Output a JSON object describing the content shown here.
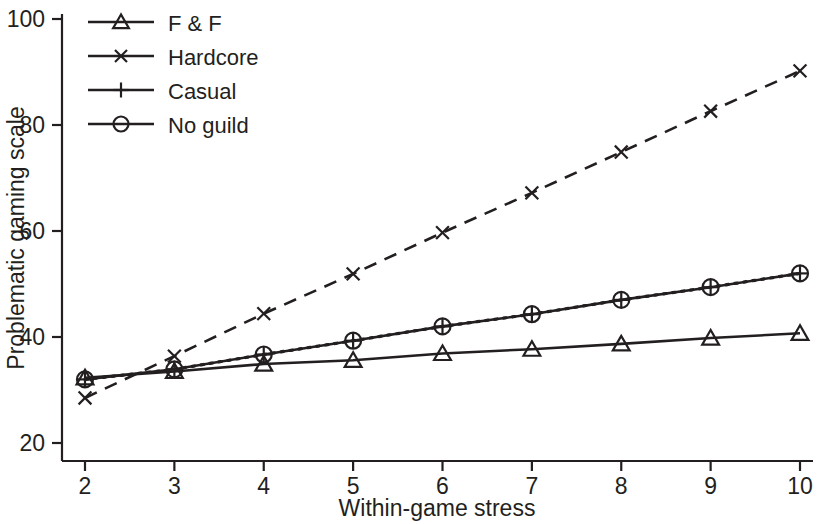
{
  "chart_data": {
    "type": "line",
    "title": "",
    "xlabel": "Within-game stress",
    "ylabel": "Problematic gaming scale",
    "x": [
      2,
      3,
      4,
      5,
      6,
      7,
      8,
      9,
      10
    ],
    "xlim": [
      2,
      10
    ],
    "ylim": [
      20,
      100
    ],
    "xticks": [
      "2",
      "3",
      "4",
      "5",
      "6",
      "7",
      "8",
      "9",
      "10"
    ],
    "yticks": [
      "20",
      "40",
      "60",
      "80",
      "100"
    ],
    "grid": false,
    "legend_position": "top-left",
    "series": [
      {
        "name": "F & F",
        "marker": "triangle",
        "linestyle": "solid",
        "color": "#231f20",
        "values": [
          32.3,
          33.5,
          34.9,
          35.6,
          36.9,
          37.7,
          38.7,
          39.8,
          40.7
        ]
      },
      {
        "name": "Hardcore",
        "marker": "cross",
        "linestyle": "dashed",
        "color": "#231f20",
        "values": [
          28.5,
          36.4,
          44.4,
          51.9,
          59.7,
          67.2,
          74.9,
          82.6,
          90.2
        ]
      },
      {
        "name": "Casual",
        "marker": "plus",
        "linestyle": "solid",
        "color": "#231f20",
        "values": [
          32.0,
          33.9,
          36.7,
          39.3,
          42.0,
          44.3,
          47.0,
          49.4,
          52.0
        ]
      },
      {
        "name": "No guild",
        "marker": "circle",
        "linestyle": "dotted",
        "color": "#231f20",
        "values": [
          32.0,
          33.9,
          36.7,
          39.3,
          42.0,
          44.3,
          47.0,
          49.4,
          52.0
        ]
      }
    ]
  },
  "legend": {
    "items": [
      {
        "label": "F & F"
      },
      {
        "label": "Hardcore"
      },
      {
        "label": "Casual"
      },
      {
        "label": "No guild"
      }
    ]
  },
  "axes": {
    "x_title": "Within-game stress",
    "y_title": "Problematic gaming scale"
  },
  "colors": {
    "ink": "#231f20",
    "background": "#ffffff"
  }
}
